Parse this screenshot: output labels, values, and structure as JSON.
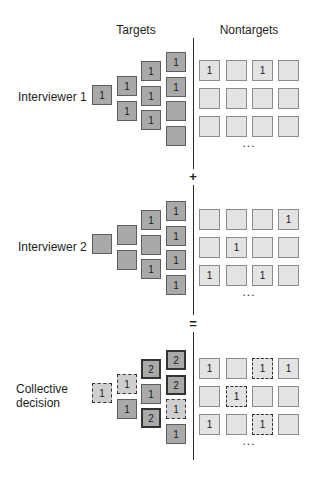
{
  "headers": {
    "targets": "Targets",
    "nontargets": "Nontargets"
  },
  "operators": {
    "plus": "+",
    "equals": "="
  },
  "ellipsis": "...",
  "sections": [
    {
      "label_lines": [
        "Interviewer 1"
      ],
      "targets": {
        "col1": [
          {
            "v": "1",
            "style": "solid"
          }
        ],
        "col2": [
          {
            "v": "1",
            "style": "solid"
          },
          {
            "v": "1",
            "style": "solid"
          }
        ],
        "col3": [
          {
            "v": "1",
            "style": "solid"
          },
          {
            "v": "1",
            "style": "solid"
          },
          {
            "v": "1",
            "style": "solid"
          }
        ],
        "col4": [
          {
            "v": "1",
            "style": "solid"
          },
          {
            "v": "1",
            "style": "solid"
          },
          {
            "v": "",
            "style": "solid"
          },
          {
            "v": "",
            "style": "solid"
          }
        ]
      },
      "nontargets": [
        [
          {
            "v": "1",
            "style": "solid"
          },
          {
            "v": "",
            "style": "solid"
          },
          {
            "v": "1",
            "style": "solid"
          },
          {
            "v": "",
            "style": "solid"
          }
        ],
        [
          {
            "v": "",
            "style": "solid"
          },
          {
            "v": "",
            "style": "solid"
          },
          {
            "v": "",
            "style": "solid"
          },
          {
            "v": "",
            "style": "solid"
          }
        ],
        [
          {
            "v": "",
            "style": "solid"
          },
          {
            "v": "",
            "style": "solid"
          },
          {
            "v": "",
            "style": "solid"
          },
          {
            "v": "",
            "style": "solid"
          }
        ]
      ]
    },
    {
      "label_lines": [
        "Interviewer 2"
      ],
      "targets": {
        "col1": [
          {
            "v": "",
            "style": "solid"
          }
        ],
        "col2": [
          {
            "v": "",
            "style": "solid"
          },
          {
            "v": "",
            "style": "solid"
          }
        ],
        "col3": [
          {
            "v": "1",
            "style": "solid"
          },
          {
            "v": "",
            "style": "solid"
          },
          {
            "v": "1",
            "style": "solid"
          }
        ],
        "col4": [
          {
            "v": "1",
            "style": "solid"
          },
          {
            "v": "1",
            "style": "solid"
          },
          {
            "v": "1",
            "style": "solid"
          },
          {
            "v": "1",
            "style": "solid"
          }
        ]
      },
      "nontargets": [
        [
          {
            "v": "",
            "style": "solid"
          },
          {
            "v": "",
            "style": "solid"
          },
          {
            "v": "",
            "style": "solid"
          },
          {
            "v": "1",
            "style": "solid"
          }
        ],
        [
          {
            "v": "",
            "style": "solid"
          },
          {
            "v": "1",
            "style": "solid"
          },
          {
            "v": "",
            "style": "solid"
          },
          {
            "v": "",
            "style": "solid"
          }
        ],
        [
          {
            "v": "1",
            "style": "solid"
          },
          {
            "v": "",
            "style": "solid"
          },
          {
            "v": "1",
            "style": "solid"
          },
          {
            "v": "",
            "style": "solid"
          }
        ]
      ]
    },
    {
      "label_lines": [
        "Collective",
        "decision"
      ],
      "targets": {
        "col1": [
          {
            "v": "1",
            "style": "dashed"
          }
        ],
        "col2": [
          {
            "v": "1",
            "style": "dashed"
          },
          {
            "v": "1",
            "style": "solid"
          }
        ],
        "col3": [
          {
            "v": "2",
            "style": "thick"
          },
          {
            "v": "1",
            "style": "solid"
          },
          {
            "v": "2",
            "style": "thick"
          }
        ],
        "col4": [
          {
            "v": "2",
            "style": "thick"
          },
          {
            "v": "2",
            "style": "thick"
          },
          {
            "v": "1",
            "style": "dashed"
          },
          {
            "v": "1",
            "style": "solid"
          }
        ]
      },
      "nontargets": [
        [
          {
            "v": "1",
            "style": "solid"
          },
          {
            "v": "",
            "style": "solid"
          },
          {
            "v": "1",
            "style": "dashed"
          },
          {
            "v": "1",
            "style": "solid"
          }
        ],
        [
          {
            "v": "",
            "style": "solid"
          },
          {
            "v": "1",
            "style": "dashed"
          },
          {
            "v": "",
            "style": "solid"
          },
          {
            "v": "",
            "style": "solid"
          }
        ],
        [
          {
            "v": "1",
            "style": "solid"
          },
          {
            "v": "",
            "style": "solid"
          },
          {
            "v": "1",
            "style": "dashed"
          },
          {
            "v": "",
            "style": "solid"
          }
        ]
      ]
    }
  ],
  "colors": {
    "target_fill": "#a9a9a9",
    "nontarget_fill": "#e3e3e3",
    "divider": "#2a2a2a"
  }
}
